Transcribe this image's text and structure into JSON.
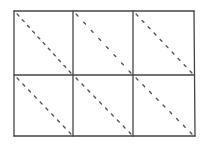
{
  "diagram": {
    "type": "grid-sketch",
    "rows": 2,
    "cols": 3,
    "stroke_color": "#444444",
    "dot_color": "#555555",
    "background": "#ffffff",
    "frame": {
      "left": 14,
      "top": 11,
      "right": 194,
      "bottom": 136
    },
    "col_dividers": [
      73,
      133
    ],
    "row_dividers": [
      75
    ],
    "cells": [
      {
        "row": 0,
        "col": 0,
        "diagonal": "top-left-to-bottom-right",
        "dots": 11
      },
      {
        "row": 0,
        "col": 1,
        "diagonal": "top-left-to-bottom-right",
        "dots": 8
      },
      {
        "row": 0,
        "col": 2,
        "diagonal": "top-left-to-bottom-right",
        "dots": 10
      },
      {
        "row": 1,
        "col": 0,
        "diagonal": "top-left-to-bottom-right",
        "dots": 10
      },
      {
        "row": 1,
        "col": 1,
        "diagonal": "top-left-to-bottom-right",
        "dots": 10
      },
      {
        "row": 1,
        "col": 2,
        "diagonal": "top-left-to-bottom-right",
        "dots": 9
      }
    ]
  }
}
